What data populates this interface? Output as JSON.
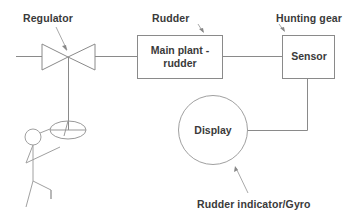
{
  "diagram": {
    "type": "block-diagram",
    "labels": {
      "regulator": "Regulator",
      "rudder": "Rudder",
      "hunting_gear": "Hunting gear",
      "rudder_indicator": "Rudder indicator/Gyro"
    },
    "nodes": {
      "main_plant": {
        "line1": "Main plant -",
        "line2": "rudder"
      },
      "sensor": {
        "label": "Sensor"
      },
      "display": {
        "label": "Display"
      }
    },
    "edges": [
      {
        "from": "input",
        "to": "regulator-valve"
      },
      {
        "from": "regulator-valve",
        "to": "main-plant-rudder"
      },
      {
        "from": "main-plant-rudder",
        "to": "sensor"
      },
      {
        "from": "sensor",
        "to": "display"
      },
      {
        "from": "steering-wheel",
        "to": "regulator-valve"
      }
    ],
    "colors": {
      "line": "#8a8a8a",
      "text": "#3a3a3a",
      "background": "#ffffff"
    }
  }
}
